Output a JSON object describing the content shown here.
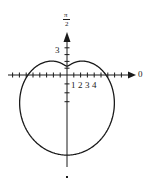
{
  "chart_data": {
    "type": "line",
    "subtype": "polar",
    "title": "",
    "equation": "r = 5 - 4 sin θ",
    "curve": {
      "a": 5,
      "b": 4
    },
    "axis_labels": {
      "polar_axis": "0",
      "vertical_axis_top": "π/2",
      "vertical_axis_top_num": "π",
      "vertical_axis_top_den": "2",
      "vertical_axis_bottom": "3π/2"
    },
    "x_tick_labels": [
      "1",
      "2",
      "3",
      "4"
    ],
    "y_tick_labels": [
      "3"
    ],
    "key_points": [
      {
        "theta": "0",
        "r": 5
      },
      {
        "theta": "π/2",
        "r": 1
      },
      {
        "theta": "π",
        "r": 5
      },
      {
        "theta": "3π/2",
        "r": 9
      }
    ],
    "grid": false,
    "legend": null
  },
  "colors": {
    "ink": "#1a1a1a",
    "background": "#ffffff"
  }
}
